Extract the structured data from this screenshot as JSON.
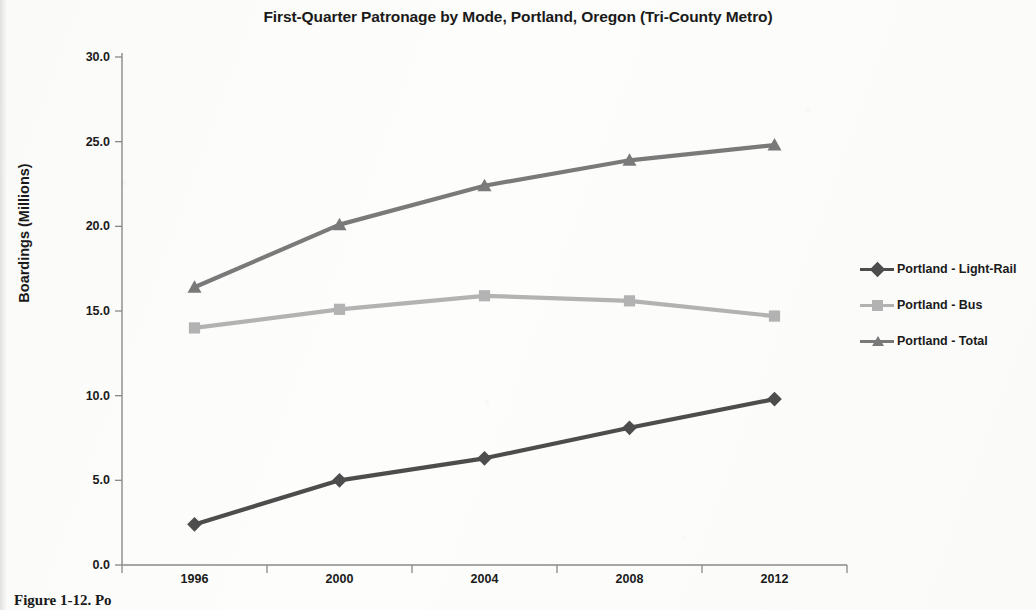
{
  "chart_data": {
    "type": "line",
    "title": "First-Quarter Patronage by Mode, Portland, Oregon (Tri-County Metro)",
    "xlabel": "",
    "ylabel": "Boardings  (Millions)",
    "categories": [
      "1996",
      "2000",
      "2004",
      "2008",
      "2012"
    ],
    "ylim": [
      0.0,
      30.0
    ],
    "ytick_labels": [
      "0.0",
      "5.0",
      "10.0",
      "15.0",
      "20.0",
      "25.0",
      "30.0"
    ],
    "yticks": [
      0.0,
      5.0,
      10.0,
      15.0,
      20.0,
      25.0,
      30.0
    ],
    "grid": false,
    "legend_position": "right",
    "series": [
      {
        "name": "Portland - Light-Rail",
        "marker": "diamond",
        "color": "#4d4d4d",
        "values": [
          2.4,
          5.0,
          6.3,
          8.1,
          9.8
        ]
      },
      {
        "name": "Portland - Bus",
        "marker": "square",
        "color": "#b3b3b3",
        "values": [
          14.0,
          15.1,
          15.9,
          15.6,
          14.7
        ]
      },
      {
        "name": "Portland - Total",
        "marker": "triangle",
        "color": "#7a7a7a",
        "values": [
          16.4,
          20.1,
          22.4,
          23.9,
          24.8
        ]
      }
    ]
  },
  "caption": {
    "text": "Figure 1-12. Po"
  }
}
